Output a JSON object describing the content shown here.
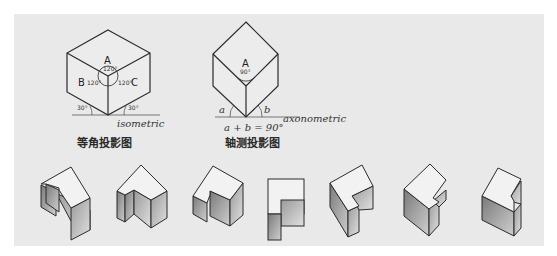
{
  "diagram": {
    "isometric": {
      "caption": "等角投影图",
      "label": "isometric",
      "face_labels": [
        "A",
        "B",
        "C"
      ],
      "angle_labels": [
        "120°",
        "120°",
        "120°"
      ],
      "base_angles": [
        "30°",
        "30°"
      ]
    },
    "axonometric": {
      "caption": "轴测投影图",
      "label": "axonometric",
      "face_label": "A",
      "angle_label": "90°",
      "base_angles": [
        "a",
        "b"
      ],
      "formula": "a + b = 90°"
    },
    "examples": {
      "count": 7,
      "items": [
        "L-block view 1",
        "L-block view 2",
        "L-block view 3",
        "plan view",
        "L-block view 4",
        "L-block view 5",
        "L-block view 6"
      ]
    },
    "colors": {
      "background": "#ffffff",
      "panel": "#e9e9e9",
      "line": "#2b2b2b",
      "shade_dark": "#8a8a8a",
      "shade_light": "#d8d8d8"
    }
  }
}
